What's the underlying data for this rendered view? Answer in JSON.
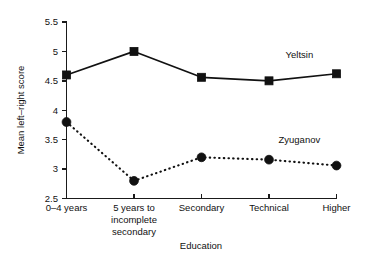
{
  "chart_data": {
    "type": "line",
    "title": "",
    "xlabel": "Education",
    "ylabel": "Mean left–right score",
    "ylim": [
      2.5,
      5.5
    ],
    "yticks": [
      "2.5",
      "3",
      "3.5",
      "4",
      "4.5",
      "5",
      "5.5"
    ],
    "ytick_values": [
      2.5,
      3,
      3.5,
      4,
      4.5,
      5,
      5.5
    ],
    "grid": false,
    "legend_position": "inline-annotation",
    "categories": [
      "0–4 years",
      "5 years to incomplete secondary",
      "Secondary",
      "Technical",
      "Higher"
    ],
    "category_lines": [
      [
        "0–4 years"
      ],
      [
        "5 years to",
        "incomplete",
        "secondary"
      ],
      [
        "Secondary"
      ],
      [
        "Technical"
      ],
      [
        "Higher"
      ]
    ],
    "series": [
      {
        "name": "Yeltsin",
        "marker": "square",
        "line_style": "solid",
        "color": "#111111",
        "values": [
          4.6,
          5.0,
          4.56,
          4.5,
          4.62
        ]
      },
      {
        "name": "Zyuganov",
        "marker": "circle",
        "line_style": "dotted",
        "color": "#111111",
        "values": [
          3.8,
          2.8,
          3.2,
          3.16,
          3.06
        ]
      }
    ],
    "annotations": [
      {
        "text": "Yeltsin",
        "x_category_index": 3.45,
        "y_value": 4.88
      },
      {
        "text": "Zyuganov",
        "x_category_index": 3.45,
        "y_value": 3.45
      }
    ]
  }
}
